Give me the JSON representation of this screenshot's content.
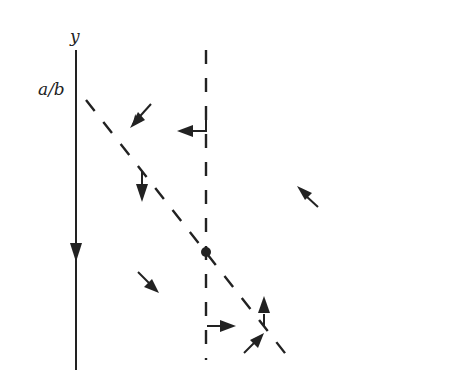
{
  "diagram": {
    "type": "phase-plane flow diagram",
    "labels": {
      "y_axis": "y",
      "tick": "a/b"
    },
    "colors": {
      "ink": "#222222",
      "background": "#ffffff"
    },
    "elements": [
      {
        "name": "y-axis",
        "kind": "solid-line",
        "direction": "downward arrow at mid"
      },
      {
        "name": "vertical-nullcline",
        "kind": "dashed-line"
      },
      {
        "name": "diagonal-nullcline",
        "kind": "dashed-line"
      },
      {
        "name": "equilibrium-point",
        "kind": "dot"
      },
      {
        "name": "flow-arrows",
        "count": 8
      }
    ]
  }
}
